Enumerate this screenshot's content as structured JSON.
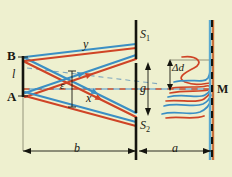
{
  "figure": {
    "kind": "optics-interference-diagram",
    "background_color": "#eef0cf",
    "width": 232,
    "height": 177
  },
  "colors": {
    "background": "#eef0cf",
    "ray_blue": "#3b8fc4",
    "ray_red": "#cf4426",
    "barrier_black": "#1a1a14",
    "axis_dash_red": "#c0452a",
    "axis_dash_blue": "#6fa9cf",
    "screen_orange": "#c8703a",
    "screen_blue": "#5aa8cf",
    "label_text": "#1a1a14"
  },
  "labels": {
    "source_top": "B",
    "source_bottom": "A",
    "source_length": "l",
    "ray_upper": "y",
    "ray_lower": "x",
    "angle_epsilon": "ε",
    "slit_top": "S",
    "slit_top_sub": "1",
    "slit_bottom": "S",
    "slit_bottom_sub": "2",
    "slit_gap": "g",
    "fringe_spacing": "Δd",
    "screen_point": "M",
    "dim_source_to_slits": "b",
    "dim_slits_to_screen": "a"
  },
  "geometry": {
    "source_x": 23,
    "source_top_y": 57,
    "source_bottom_y": 96,
    "barrier_x": 136,
    "slit_top_y": 61,
    "slit_bottom_y": 115,
    "screen_x": 212,
    "axis_y": 89,
    "dimension_line_y": 151,
    "barrier_top_y": 20,
    "barrier_bottom_y": 160
  },
  "elements": {
    "source_segment_name": "source-slit-AB",
    "barrier_name": "double-slit-barrier",
    "screen_name": "observation-screen",
    "fringes_name": "interference-fringe-pattern"
  }
}
